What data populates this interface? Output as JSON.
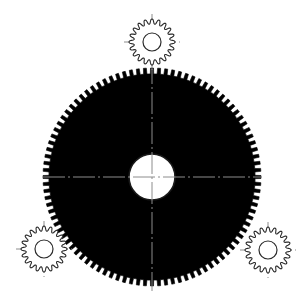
{
  "canvas": {
    "width": 305,
    "height": 305,
    "background_color": "#ffffff",
    "title": "Planetary gear assembly drawing"
  },
  "style": {
    "line_color": "#1a1a1a",
    "tooth_color": "#000000",
    "body_fill_color": "#d9d9d9",
    "bore_fill_color": "#ffffff",
    "centerline_color": "#8c8c8c",
    "pinion_outline_color": "#2b2b2b",
    "stipple_dot_color": "#b5b5b5"
  },
  "parts": [
    {
      "id": "ring-gear",
      "name": "Large gear wheel",
      "type": "spur-gear",
      "center": {
        "x": 152,
        "y": 177
      },
      "outer_radius": 109,
      "root_radius": 103,
      "tooth_count": 96,
      "bore_radius": 23,
      "fill": "stipple-gray",
      "label": "Large gear"
    },
    {
      "id": "pinion-top",
      "name": "Top pinion gear",
      "type": "spur-gear",
      "center": {
        "x": 152,
        "y": 42
      },
      "outer_radius": 23,
      "root_radius": 18,
      "tooth_count": 20,
      "bore_radius": 9,
      "fill": "none",
      "label": "Pinion 1"
    },
    {
      "id": "pinion-bottom-left",
      "name": "Bottom-left pinion gear",
      "type": "spur-gear",
      "center": {
        "x": 44,
        "y": 249
      },
      "outer_radius": 23,
      "root_radius": 18,
      "tooth_count": 20,
      "bore_radius": 9,
      "fill": "none",
      "label": "Pinion 2"
    },
    {
      "id": "pinion-bottom-right",
      "name": "Bottom-right pinion gear",
      "type": "spur-gear",
      "center": {
        "x": 268,
        "y": 250
      },
      "outer_radius": 23,
      "root_radius": 18,
      "tooth_count": 20,
      "bore_radius": 9,
      "fill": "none",
      "label": "Pinion 3"
    }
  ],
  "centerlines": [
    {
      "id": "ring-gear-h",
      "part": "ring-gear",
      "orientation": "horizontal",
      "x1": 43,
      "y1": 177,
      "x2": 262,
      "y2": 177
    },
    {
      "id": "ring-gear-v",
      "part": "ring-gear",
      "orientation": "vertical",
      "x1": 152,
      "y1": 62,
      "x2": 152,
      "y2": 291
    },
    {
      "id": "pinion-top-h",
      "part": "pinion-top",
      "orientation": "horizontal",
      "x1": 124,
      "y1": 42,
      "x2": 180,
      "y2": 42
    },
    {
      "id": "pinion-top-v",
      "part": "pinion-top",
      "orientation": "vertical",
      "x1": 152,
      "y1": 14,
      "x2": 152,
      "y2": 70
    },
    {
      "id": "pinion-bl-h",
      "part": "pinion-bottom-left",
      "orientation": "horizontal",
      "x1": 16,
      "y1": 249,
      "x2": 72,
      "y2": 249
    },
    {
      "id": "pinion-bl-v",
      "part": "pinion-bottom-left",
      "orientation": "vertical",
      "x1": 44,
      "y1": 221,
      "x2": 44,
      "y2": 277
    },
    {
      "id": "pinion-br-h",
      "part": "pinion-bottom-right",
      "orientation": "horizontal",
      "x1": 240,
      "y1": 250,
      "x2": 296,
      "y2": 250
    },
    {
      "id": "pinion-br-v",
      "part": "pinion-bottom-right",
      "orientation": "vertical",
      "x1": 268,
      "y1": 222,
      "x2": 268,
      "y2": 278
    }
  ]
}
